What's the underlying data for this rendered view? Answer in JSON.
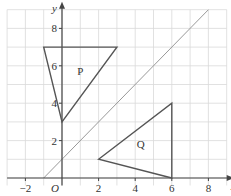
{
  "diagram": {
    "axes": {
      "x_label": "x",
      "y_label": "y",
      "origin_label": "O",
      "x_ticks": [
        {
          "v": -2,
          "t": "−2"
        },
        {
          "v": 2,
          "t": "2"
        },
        {
          "v": 4,
          "t": "4"
        },
        {
          "v": 6,
          "t": "6"
        },
        {
          "v": 8,
          "t": "8"
        }
      ],
      "y_ticks": [
        {
          "v": 2,
          "t": "2"
        },
        {
          "v": 4,
          "t": "4"
        },
        {
          "v": 6,
          "t": "6"
        },
        {
          "v": 8,
          "t": "8"
        }
      ],
      "x_range": [
        -3,
        9
      ],
      "y_range": [
        -0.4,
        9
      ]
    },
    "shapes": [
      {
        "name": "P",
        "vertices": [
          [
            -1,
            7
          ],
          [
            3,
            7
          ],
          [
            0,
            3
          ]
        ],
        "label_pos": [
          1,
          5.5
        ]
      },
      {
        "name": "Q",
        "vertices": [
          [
            2,
            1
          ],
          [
            6,
            4
          ],
          [
            6,
            0
          ]
        ],
        "label_pos": [
          4.3,
          1.6
        ]
      }
    ],
    "line": {
      "equation": "y = x + 1",
      "from": [
        -1,
        0
      ],
      "to": [
        8,
        9
      ]
    },
    "colors": {
      "grid": "#d9d9d9",
      "axis": "#444444",
      "shape": "#555555",
      "line": "#999999"
    }
  }
}
